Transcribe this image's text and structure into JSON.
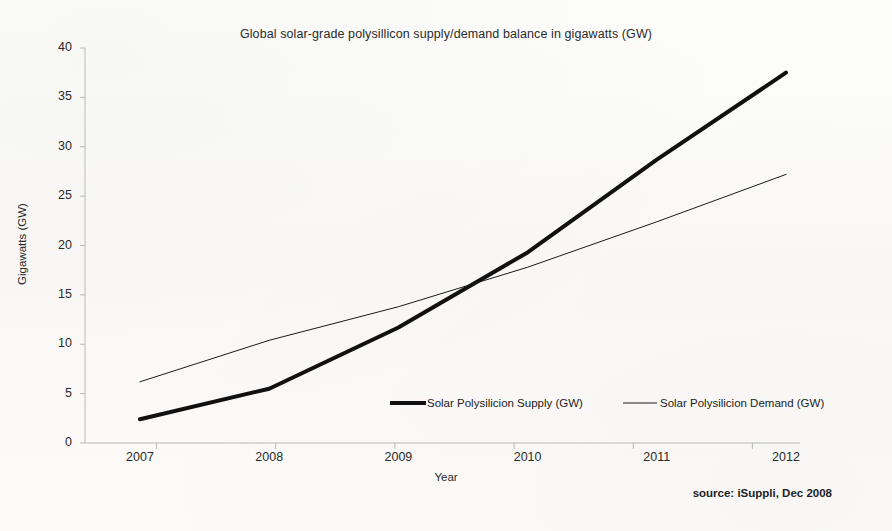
{
  "chart_data": {
    "type": "line",
    "title": "Global solar-grade polysillicon supply/demand balance in gigawatts (GW)",
    "xlabel": "Year",
    "ylabel": "Gigawatts (GW)",
    "categories": [
      "2007",
      "2008",
      "2009",
      "2010",
      "2011",
      "2012"
    ],
    "x_tick_labels": [
      "2007",
      "2008",
      "2009",
      "2010",
      "2011",
      "2012"
    ],
    "y_tick_labels": [
      "0",
      "5",
      "10",
      "15",
      "20",
      "25",
      "30",
      "35",
      "40"
    ],
    "y_ticks": [
      0,
      5,
      10,
      15,
      20,
      25,
      30,
      35,
      40
    ],
    "ylim": [
      0,
      40
    ],
    "grid": false,
    "legend_position": "inside-bottom-center",
    "series": [
      {
        "name": "Solar Polysilicion Supply (GW)",
        "values": [
          2.4,
          5.5,
          11.7,
          19.3,
          28.7,
          37.5
        ],
        "line_width": 4,
        "color": "#111111"
      },
      {
        "name": "Solar Polysilicion Demand (GW)",
        "values": [
          6.2,
          10.4,
          13.8,
          17.8,
          22.4,
          27.2
        ],
        "line_width": 1,
        "color": "#1a1a1a"
      }
    ],
    "annotations": [
      "source: iSuppli, Dec 2008"
    ]
  },
  "legend": {
    "supply_label": "Solar Polysilicion Supply (GW)",
    "demand_label": "Solar Polysilicion Demand (GW)"
  },
  "footer": {
    "source": "source: iSuppli, Dec 2008"
  },
  "colors": {
    "background": "#fbfbf9",
    "axis": "#b9b9b9",
    "text": "#2a2a2a",
    "supply_line": "#111111",
    "demand_line": "#1a1a1a"
  }
}
